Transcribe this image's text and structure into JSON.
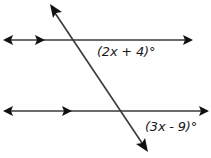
{
  "diagram": {
    "type": "parallel-lines-transversal",
    "lines": [
      {
        "id": "top-line",
        "parallel_marker": "single-arrow",
        "bidirectional": true
      },
      {
        "id": "bottom-line",
        "parallel_marker": "single-arrow",
        "bidirectional": true
      },
      {
        "id": "transversal",
        "bidirectional": true
      }
    ],
    "angles": [
      {
        "id": "top-angle",
        "label": "(2x + 4)°",
        "position": "below-right of top intersection"
      },
      {
        "id": "bottom-angle",
        "label": "(3x - 9)°",
        "position": "below-right of bottom intersection"
      }
    ],
    "colors": {
      "line": "#3a3a3a",
      "arrowhead": "#111111",
      "text": "#1a1a1a",
      "background": "#ffffff"
    }
  }
}
